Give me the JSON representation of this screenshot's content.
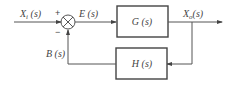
{
  "diagram": {
    "type": "closed-loop feedback block diagram",
    "signals": {
      "input": {
        "main": "X",
        "sub": "i",
        "arg": " (s)"
      },
      "error": "E (s)",
      "output": {
        "main": "X",
        "sub": "o",
        "arg": "(s)"
      },
      "feedback": "B (s)"
    },
    "blocks": {
      "forward": "G (s)",
      "feedback": "H (s)"
    },
    "summing_junction": {
      "plus_sign": "+",
      "minus_sign": "−"
    },
    "colors": {
      "line": "#555555",
      "text": "#444444"
    }
  }
}
